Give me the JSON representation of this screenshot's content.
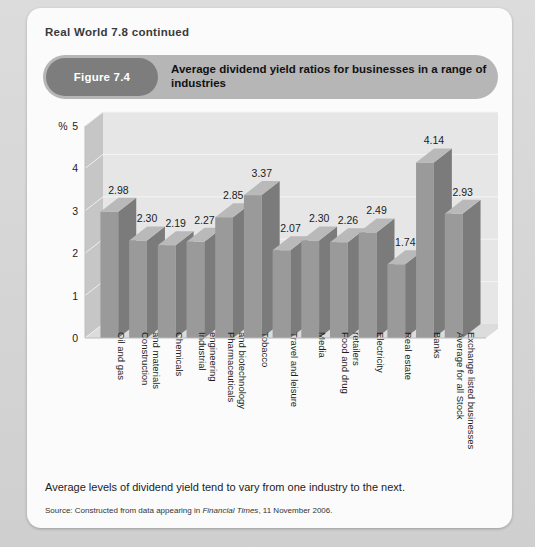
{
  "page": {
    "running_head": "Real World 7.8 continued"
  },
  "figure": {
    "number_label": "Figure 7.4",
    "title": "Average dividend yield ratios for businesses in a range of industries",
    "caption": "Average levels of dividend yield tend to vary from one industry to the next.",
    "source_prefix": "Source: Constructed from data appearing in ",
    "source_publication": "Financial Times",
    "source_suffix": ", 11 November 2006."
  },
  "colors": {
    "page_background": "#d8d8d8",
    "card_background": "#fbfbfb",
    "title_bar": "#b6b6b6",
    "figure_pill": "#7d7d7d",
    "bar_front": "#9a9a9a",
    "bar_side": "#7b7b7b",
    "bar_top": "#b9b9b9",
    "plot_background": "#e6e6e6",
    "wall_side": "#c6c6c6",
    "gridline": "#f4f4f4",
    "text": "#1c1c1c"
  },
  "chart_data": {
    "type": "bar",
    "title": "Average dividend yield ratios for businesses in a range of industries",
    "xlabel": "",
    "ylabel": "%",
    "ylim": [
      0,
      5
    ],
    "yticks": [
      0,
      1,
      2,
      3,
      4,
      5
    ],
    "ytick_labels": [
      "0",
      "1",
      "2",
      "3",
      "4",
      "5"
    ],
    "axis_unit_label": "%",
    "grid": true,
    "legend": false,
    "data_labels": true,
    "style": "3d-column",
    "categories": [
      "Oil and gas",
      "Construction and materials",
      "Chemicals",
      "Industrial engineering",
      "Pharmaceuticals and biotechnology",
      "Tobacco",
      "Travel and leisure",
      "Media",
      "Food and drug retailers",
      "Electricity",
      "Real estate",
      "Banks",
      "Average for all Stock Exchange listed businesses"
    ],
    "values": [
      2.98,
      2.3,
      2.19,
      2.27,
      2.85,
      3.37,
      2.07,
      2.3,
      2.26,
      2.49,
      1.74,
      4.14,
      2.93
    ],
    "value_labels": [
      "2.98",
      "2.30",
      "2.19",
      "2.27",
      "2.85",
      "3.37",
      "2.07",
      "2.30",
      "2.26",
      "2.49",
      "1.74",
      "4.14",
      "2.93"
    ]
  }
}
